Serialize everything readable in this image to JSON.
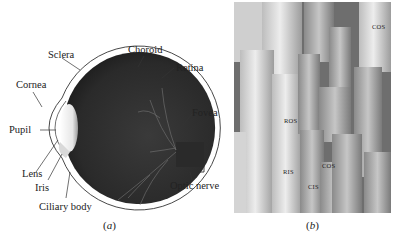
{
  "figure": {
    "panel_a": {
      "caption_letter": "a",
      "title": "Human eye cross-section",
      "labels": {
        "sclera": "Sclera",
        "choroid": "Choroid",
        "retina": "Retina",
        "cornea": "Cornea",
        "fovea": "Fovea",
        "pupil": "Pupil",
        "lens": "Lens",
        "iris": "Iris",
        "ciliary_body": "Ciliary body",
        "optic_nerve": "Optic nerve"
      }
    },
    "panel_b": {
      "caption_letter": "b",
      "title": "Electron micrograph of rods and cones",
      "labels": {
        "ros": "ROS",
        "ris": "RIS",
        "cos_top": "COS",
        "cos_mid": "COS",
        "cis": "CIS"
      }
    },
    "colors": {
      "eyeball": "#2e2e2e",
      "sclera_line": "#333333",
      "lens": "#e8e8e8",
      "vessels": "#6a6a6a"
    }
  }
}
